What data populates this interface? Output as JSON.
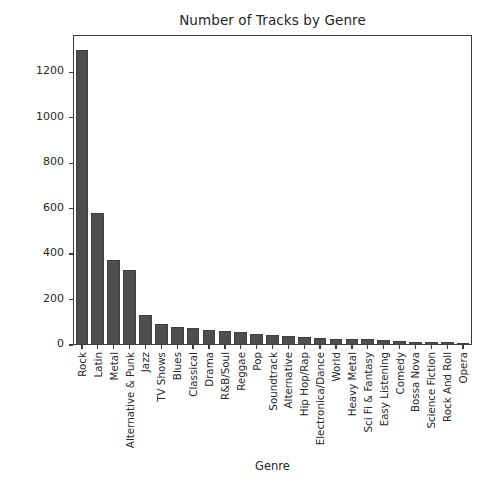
{
  "artifact": {
    "top_fragment_text": "· ·"
  },
  "chart_data": {
    "type": "bar",
    "title": "Number of Tracks by Genre",
    "xlabel": "Genre",
    "ylabel": "Tracks",
    "grid": false,
    "legend": null,
    "ylim": [
      0,
      1360
    ],
    "yticks": [
      0,
      200,
      400,
      600,
      800,
      1000,
      1200
    ],
    "ytick_labels": [
      "0",
      "200",
      "400",
      "600",
      "800",
      "1000",
      "1200"
    ],
    "bar_color": "#4e4e4e",
    "edge_color": "#3f3f3f",
    "categories": [
      "Rock",
      "Latin",
      "Metal",
      "Alternative & Punk",
      "Jazz",
      "TV Shows",
      "Blues",
      "Classical",
      "Drama",
      "R&B/Soul",
      "Reggae",
      "Pop",
      "Soundtrack",
      "Alternative",
      "Hip Hop/Rap",
      "Electronica/Dance",
      "World",
      "Heavy Metal",
      "Sci Fi & Fantasy",
      "Easy Listening",
      "Comedy",
      "Bossa Nova",
      "Science Fiction",
      "Rock And Roll",
      "Opera"
    ],
    "values": [
      1297,
      579,
      374,
      332,
      130,
      93,
      81,
      74,
      64,
      61,
      58,
      48,
      43,
      40,
      35,
      30,
      28,
      28,
      26,
      24,
      17,
      15,
      13,
      12,
      1
    ]
  }
}
